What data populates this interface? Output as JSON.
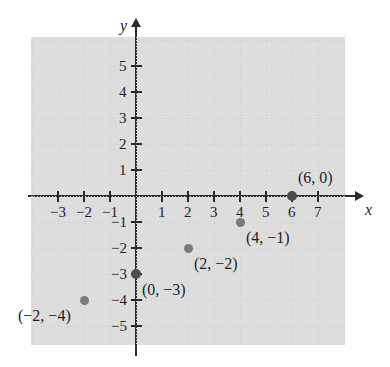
{
  "chart_data": {
    "type": "scatter",
    "title": "",
    "xlabel": "x",
    "ylabel": "y",
    "xlim": [
      -4,
      8
    ],
    "ylim": [
      -6,
      6
    ],
    "grid": true,
    "legend": null,
    "x_ticks": [
      "-3",
      "-2",
      "-1",
      "1",
      "2",
      "3",
      "4",
      "5",
      "6",
      "7"
    ],
    "x_tick_values": [
      -3,
      -2,
      -1,
      1,
      2,
      3,
      4,
      5,
      6,
      7
    ],
    "y_ticks": [
      "5",
      "4",
      "3",
      "2",
      "1",
      "-1",
      "-2",
      "-3",
      "-4",
      "-5"
    ],
    "y_tick_values": [
      5,
      4,
      3,
      2,
      1,
      -1,
      -2,
      -3,
      -4,
      -5
    ],
    "point_color": "#7a7a7a",
    "axis_color": "#2b2b2b",
    "grid_color": "#d8d8d8",
    "points": [
      {
        "x": 6,
        "y": 0,
        "label": "(6, 0)",
        "label_dx": 6,
        "label_dy": -26
      },
      {
        "x": 4,
        "y": -1,
        "label": "(4, −1)",
        "label_dx": 6,
        "label_dy": 8
      },
      {
        "x": 2,
        "y": -2,
        "label": "(2, −2)",
        "label_dx": 6,
        "label_dy": 8
      },
      {
        "x": 0,
        "y": -3,
        "label": "(0, −3)",
        "label_dx": 6,
        "label_dy": 8
      },
      {
        "x": -2,
        "y": -4,
        "label": "(−2, −4)",
        "label_dx": -66,
        "label_dy": 8
      }
    ]
  },
  "axes": {
    "x_axis_label": "x",
    "y_axis_label": "y"
  }
}
